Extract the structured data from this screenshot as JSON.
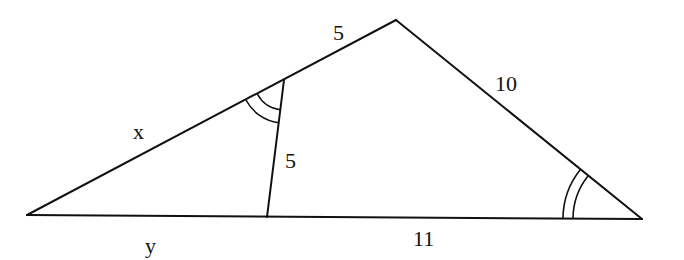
{
  "diagram": {
    "type": "triangle-with-cevian",
    "colors": {
      "stroke": "#111111",
      "background": "#ffffff"
    },
    "vertices": {
      "A": {
        "x": 27,
        "y": 215
      },
      "B": {
        "x": 396,
        "y": 20
      },
      "C": {
        "x": 642,
        "y": 219
      },
      "D": {
        "x": 284,
        "y": 80
      },
      "E": {
        "x": 267,
        "y": 217
      }
    },
    "segments": [
      {
        "from": "A",
        "to": "D",
        "label": "x"
      },
      {
        "from": "D",
        "to": "B",
        "label": "5"
      },
      {
        "from": "B",
        "to": "C",
        "label": "10"
      },
      {
        "from": "A",
        "to": "E",
        "label": "y"
      },
      {
        "from": "E",
        "to": "C",
        "label": "11"
      },
      {
        "from": "D",
        "to": "E",
        "label": "5"
      }
    ],
    "angle_marks": [
      {
        "vertex": "D",
        "arcs": 2,
        "note": "equal to angle at C"
      },
      {
        "vertex": "C",
        "arcs": 2,
        "note": "equal to angle at D"
      }
    ],
    "labels": {
      "x": "x",
      "y": "y",
      "db": "5",
      "de": "5",
      "bc": "10",
      "ec": "11"
    }
  }
}
